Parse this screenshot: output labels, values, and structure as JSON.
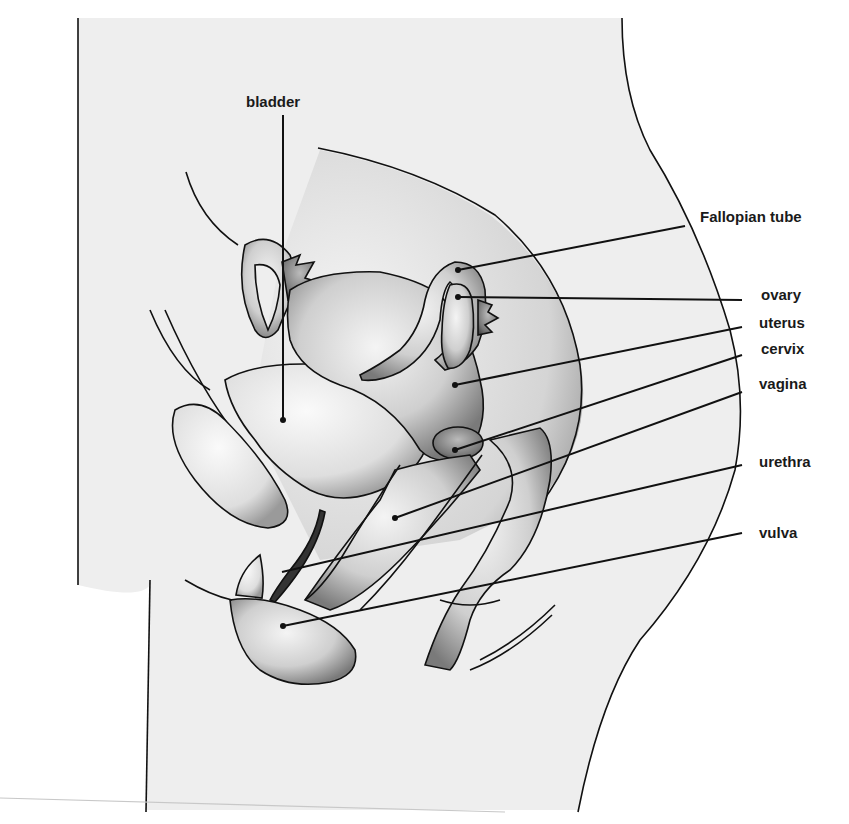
{
  "title_fragment": "",
  "diagram": {
    "labels": [
      {
        "id": "bladder",
        "text": "bladder"
      },
      {
        "id": "fallopian-tube",
        "text": "Fallopian tube"
      },
      {
        "id": "ovary",
        "text": "ovary"
      },
      {
        "id": "uterus",
        "text": "uterus"
      },
      {
        "id": "cervix",
        "text": "cervix"
      },
      {
        "id": "vagina",
        "text": "vagina"
      },
      {
        "id": "urethra",
        "text": "urethra"
      },
      {
        "id": "vulva",
        "text": "vulva"
      }
    ]
  },
  "colors": {
    "background": "#ffffff",
    "body_fill": "#eeeeee",
    "line": "#111111"
  }
}
